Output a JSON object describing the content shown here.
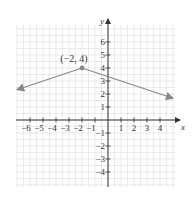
{
  "chart_data": {
    "type": "line",
    "title": "",
    "xlabel": "x",
    "ylabel": "y",
    "xlim": [
      -7,
      5
    ],
    "ylim": [
      -5,
      7
    ],
    "grid": true,
    "x_ticks": [
      -6,
      -5,
      -4,
      -3,
      -2,
      -1,
      1,
      2,
      3,
      4
    ],
    "y_ticks": [
      -4,
      -3,
      -2,
      -1,
      1,
      2,
      3,
      4,
      5,
      6
    ],
    "x_tick_labels": [
      "−6",
      "−5",
      "−4",
      "−3",
      "−2",
      "−1",
      "1",
      "2",
      "3",
      "4"
    ],
    "y_tick_labels": [
      "−4",
      "−3",
      "−2",
      "−1",
      "1",
      "2",
      "3",
      "4",
      "5",
      "6"
    ],
    "series": [
      {
        "name": "y = -1/3|x + 2| + 4",
        "x": [
          -7,
          -2,
          5
        ],
        "y": [
          2.33,
          4,
          1.67
        ],
        "arrows": "both",
        "color": "#888888"
      }
    ],
    "annotations": [
      {
        "text": "(−2, 4)",
        "x": -2,
        "y": 4,
        "marker": "point"
      }
    ]
  }
}
